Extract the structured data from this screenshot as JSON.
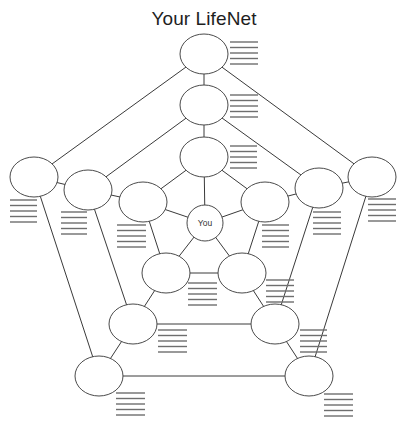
{
  "title": "Your LifeNet",
  "center": {
    "id": "you",
    "label": "You",
    "cx": 205,
    "cy": 223,
    "r": 18
  },
  "node_size": {
    "rx": 24,
    "ry": 20
  },
  "nodes": [
    {
      "id": "t0",
      "cx": 204,
      "cy": 54
    },
    {
      "id": "t1",
      "cx": 204,
      "cy": 105
    },
    {
      "id": "t2",
      "cx": 204,
      "cy": 157
    },
    {
      "id": "l0",
      "cx": 34,
      "cy": 177
    },
    {
      "id": "l1",
      "cx": 88,
      "cy": 190
    },
    {
      "id": "l2",
      "cx": 143,
      "cy": 202
    },
    {
      "id": "r0",
      "cx": 372,
      "cy": 177
    },
    {
      "id": "r1",
      "cx": 319,
      "cy": 188
    },
    {
      "id": "r2",
      "cx": 265,
      "cy": 202
    },
    {
      "id": "bl2",
      "cx": 166,
      "cy": 273
    },
    {
      "id": "br2",
      "cx": 242,
      "cy": 273
    },
    {
      "id": "bl1",
      "cx": 133,
      "cy": 324
    },
    {
      "id": "br1",
      "cx": 275,
      "cy": 324
    },
    {
      "id": "bl0",
      "cx": 99,
      "cy": 376
    },
    {
      "id": "br0",
      "cx": 309,
      "cy": 376
    }
  ],
  "edges": [
    [
      "t0",
      "l0"
    ],
    [
      "l0",
      "bl0"
    ],
    [
      "bl0",
      "br0"
    ],
    [
      "br0",
      "r0"
    ],
    [
      "r0",
      "t0"
    ],
    [
      "t0",
      "t1"
    ],
    [
      "t1",
      "t2"
    ],
    [
      "t2",
      "you"
    ],
    [
      "l0",
      "l1"
    ],
    [
      "l1",
      "l2"
    ],
    [
      "l2",
      "you"
    ],
    [
      "r0",
      "r1"
    ],
    [
      "r1",
      "r2"
    ],
    [
      "r2",
      "you"
    ],
    [
      "bl0",
      "bl1"
    ],
    [
      "bl1",
      "bl2"
    ],
    [
      "bl2",
      "you"
    ],
    [
      "br0",
      "br1"
    ],
    [
      "br1",
      "br2"
    ],
    [
      "br2",
      "you"
    ],
    [
      "t1",
      "l1"
    ],
    [
      "t1",
      "r1"
    ],
    [
      "l1",
      "bl1"
    ],
    [
      "r1",
      "br1"
    ],
    [
      "bl1",
      "br1"
    ],
    [
      "t2",
      "l2"
    ],
    [
      "t2",
      "r2"
    ],
    [
      "l2",
      "bl2"
    ],
    [
      "r2",
      "br2"
    ],
    [
      "bl2",
      "br2"
    ]
  ],
  "write_lines": {
    "count": 5,
    "spacing": 5.5,
    "blocks": [
      {
        "node": "t0",
        "x": 230,
        "y": 42,
        "w": 28
      },
      {
        "node": "t1",
        "x": 230,
        "y": 95,
        "w": 28
      },
      {
        "node": "t2",
        "x": 230,
        "y": 146,
        "w": 27
      },
      {
        "node": "l0",
        "x": 10,
        "y": 200,
        "w": 27
      },
      {
        "node": "l1",
        "x": 61,
        "y": 212,
        "w": 26
      },
      {
        "node": "l2",
        "x": 117,
        "y": 225,
        "w": 29
      },
      {
        "node": "r2",
        "x": 262,
        "y": 225,
        "w": 27
      },
      {
        "node": "r1",
        "x": 313,
        "y": 212,
        "w": 28
      },
      {
        "node": "r0",
        "x": 368,
        "y": 199,
        "w": 28
      },
      {
        "node": "bl2",
        "x": 188,
        "y": 283,
        "w": 29
      },
      {
        "node": "br2",
        "x": 266,
        "y": 280,
        "w": 28
      },
      {
        "node": "bl1",
        "x": 158,
        "y": 330,
        "w": 29
      },
      {
        "node": "br1",
        "x": 300,
        "y": 330,
        "w": 27
      },
      {
        "node": "bl0",
        "x": 116,
        "y": 393,
        "w": 29
      },
      {
        "node": "br0",
        "x": 324,
        "y": 394,
        "w": 29
      }
    ]
  }
}
